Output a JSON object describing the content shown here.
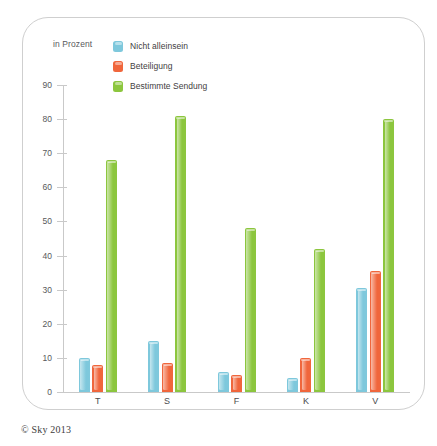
{
  "chart_data": {
    "type": "bar",
    "title": "",
    "subtitle": "",
    "xlabel": "",
    "ylabel": "in Prozent",
    "ylim": [
      0,
      90
    ],
    "yticks": [
      0,
      10,
      20,
      30,
      40,
      50,
      60,
      70,
      80,
      90
    ],
    "ytick_labels": [
      "0",
      "10",
      "20",
      "30",
      "40",
      "50",
      "60",
      "70",
      "80",
      "90"
    ],
    "grid": false,
    "legend_position": "top-left",
    "categories": [
      "T",
      "S",
      "F",
      "K",
      "V"
    ],
    "series": [
      {
        "name": "Nicht alleinsein",
        "color": "#7EC8DC",
        "values": [
          10,
          15,
          6,
          4,
          30.5
        ]
      },
      {
        "name": "Beteiligung",
        "color": "#F0663C",
        "values": [
          8,
          8.5,
          5,
          10,
          35.5
        ]
      },
      {
        "name": "Bestimmte Sendung",
        "color": "#8CC63E",
        "values": [
          68,
          81,
          48,
          42,
          80
        ]
      }
    ]
  },
  "legend": {
    "unit_label": "in Prozent",
    "entries": [
      {
        "label": "Nicht alleinsein",
        "color": "#7EC8DC"
      },
      {
        "label": "Beteiligung",
        "color": "#F0663C"
      },
      {
        "label": "Bestimmte Sendung",
        "color": "#8CC63E"
      }
    ]
  },
  "footer": {
    "credit": "© Sky 2013"
  },
  "colors": {
    "series_blue": "#7EC8DC",
    "series_orange": "#F0663C",
    "series_green": "#8CC63E",
    "axis": "#C9C9C9",
    "frame": "#CFCFCF",
    "text": "#58595B",
    "background": "#FFFFFF"
  }
}
